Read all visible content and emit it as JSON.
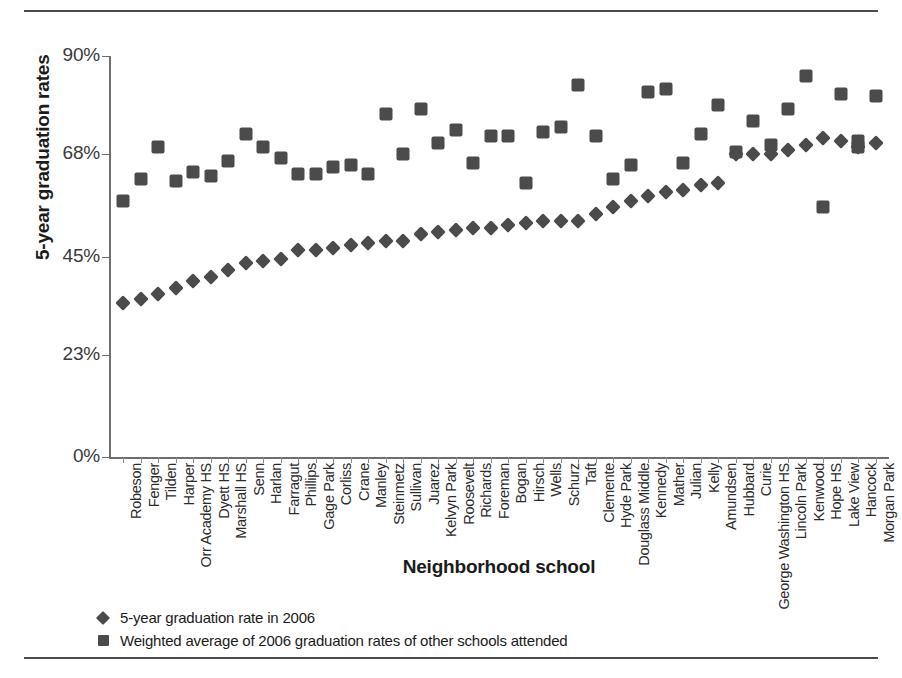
{
  "axes": {
    "y_title": "5-year graduation rates",
    "x_title": "Neighborhood school",
    "y_ticks": [
      "0%",
      "23%",
      "45%",
      "68%",
      "90%"
    ]
  },
  "legend": {
    "series1_label": "5-year graduation rate in 2006",
    "series1_marker": "diamond-marker",
    "series2_label": "Weighted average of 2006 graduation rates of other schools attended",
    "series2_marker": "square-marker"
  },
  "colors": {
    "marker": "#4b4b4b",
    "axis": "#6e6e6e",
    "rule": "#4a4a4a",
    "text": "#231f20"
  },
  "chart_data": {
    "type": "scatter",
    "title": "",
    "xlabel": "Neighborhood school",
    "ylabel": "5-year graduation rates",
    "ylim": [
      0,
      90
    ],
    "ytick_values": [
      0,
      23,
      45,
      68,
      90
    ],
    "ytick_labels": [
      "0%",
      "23%",
      "45%",
      "68%",
      "90%"
    ],
    "grid": false,
    "legend_position": "bottom-left",
    "categories": [
      "Robeson",
      "Fenger",
      "Tilden",
      "Harper",
      "Orr Academy HS",
      "Dyett HS",
      "Marshall HS",
      "Senn",
      "Harlan",
      "Farragut",
      "Phillips",
      "Gage Park",
      "Corliss",
      "Crane",
      "Manley",
      "Steinmetz",
      "Sullivan",
      "Juarez",
      "Kelvyn Park",
      "Roosevelt",
      "Richards",
      "Foreman",
      "Bogan",
      "Hirsch",
      "Wells",
      "Schurz",
      "Taft",
      "Clemente",
      "Hyde Park",
      "Douglass Middle",
      "Kennedy",
      "Mather",
      "Julian",
      "Kelly",
      "Amundsen",
      "Hubbard",
      "Curie",
      "George Washington HS",
      "Lincoln Park",
      "Kenwood",
      "Hope HS",
      "Lake View",
      "Hancock",
      "Morgan Park"
    ],
    "series": [
      {
        "name": "5-year graduation rate in 2006",
        "marker": "diamond",
        "values": [
          34.5,
          35.5,
          36.5,
          38.0,
          39.5,
          40.5,
          42.0,
          43.5,
          44.0,
          44.5,
          46.5,
          46.5,
          47.0,
          47.5,
          48.0,
          48.5,
          48.5,
          50.0,
          50.5,
          51.0,
          51.5,
          51.5,
          52.0,
          52.5,
          53.0,
          53.0,
          53.0,
          54.5,
          56.0,
          57.5,
          58.5,
          59.5,
          60.0,
          61.0,
          61.5,
          68.0,
          68.0,
          68.0,
          69.0,
          70.0,
          71.5,
          71.0,
          69.5,
          70.5
        ]
      },
      {
        "name": "Weighted average of 2006 graduation rates of other schools attended",
        "marker": "square",
        "values": [
          57.5,
          62.5,
          69.5,
          62.0,
          64.0,
          63.0,
          66.5,
          72.5,
          69.5,
          67.0,
          63.5,
          63.5,
          65.0,
          65.5,
          63.5,
          77.0,
          68.0,
          78.0,
          70.5,
          73.5,
          66.0,
          72.0,
          72.0,
          61.5,
          73.0,
          74.0,
          83.5,
          72.0,
          62.5,
          65.5,
          82.0,
          82.5,
          66.0,
          72.5,
          79.0,
          68.5,
          75.5,
          70.0,
          78.0,
          85.5,
          56.0,
          81.5,
          69.5,
          81.0
        ]
      },
      {
        "name": "extra-square-points",
        "marker": "square",
        "values": [
          null,
          null,
          null,
          null,
          null,
          null,
          null,
          null,
          null,
          null,
          null,
          null,
          null,
          null,
          null,
          null,
          null,
          null,
          null,
          null,
          null,
          null,
          null,
          null,
          null,
          null,
          null,
          null,
          null,
          null,
          null,
          null,
          null,
          null,
          null,
          null,
          null,
          null,
          null,
          null,
          null,
          null,
          71.0,
          null
        ]
      }
    ]
  }
}
